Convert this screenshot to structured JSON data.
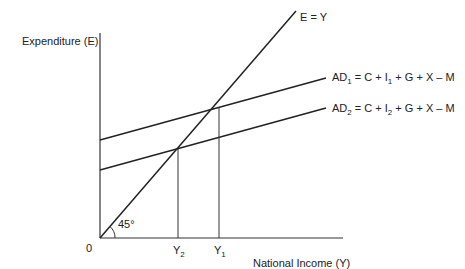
{
  "diagram": {
    "y_axis_label": "Expenditure (E)",
    "x_axis_label": "National Income (Y)",
    "origin_label": "0",
    "angle_label": "45°",
    "lines": {
      "e_equals_y": "E = Y",
      "ad1": {
        "prefix": "AD",
        "sub": "1",
        "middle": " = C + I",
        "isub": "1",
        "suffix": " + G + X – M"
      },
      "ad2": {
        "prefix": "AD",
        "sub": "2",
        "middle": " = C + I",
        "isub": "2",
        "suffix": " + G + X – M"
      }
    },
    "x_ticks": {
      "y2": {
        "main": "Y",
        "sub": "2"
      },
      "y1": {
        "main": "Y",
        "sub": "1"
      }
    },
    "colors": {
      "line": "#222222",
      "axis": "#333333",
      "background": "#ffffff"
    }
  }
}
